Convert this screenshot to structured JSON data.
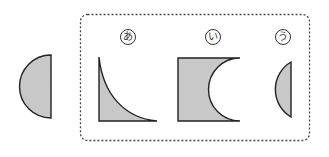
{
  "diagram": {
    "type": "shape-matching",
    "source_shape": {
      "description": "semicircle (left half of circle), flat side on right"
    },
    "choices": [
      {
        "label": "あ",
        "description": "right-angle shape with concave curved hypotenuse"
      },
      {
        "label": "い",
        "description": "rectangle with semicircular cut-out on right side"
      },
      {
        "label": "う",
        "description": "small circular segment, flat side on right"
      }
    ],
    "colors": {
      "fill": "#c8c8c8",
      "stroke": "#222222",
      "border": "#444444"
    }
  }
}
